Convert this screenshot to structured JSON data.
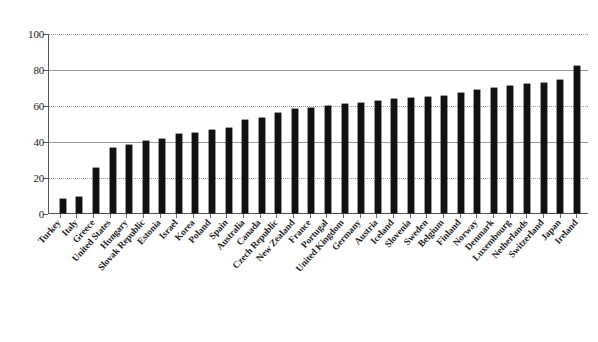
{
  "chart_data": {
    "type": "bar",
    "title": "",
    "subtitle": "",
    "xlabel": "",
    "ylabel": "",
    "ylim": [
      0,
      100
    ],
    "yticks": [
      0,
      20,
      40,
      60,
      80,
      100
    ],
    "grid": "horizontal",
    "legend": "none",
    "orientation": "vertical",
    "sorted": "ascending",
    "bar_color": "#111111",
    "categories": [
      "Turkey",
      "Italy",
      "Greece",
      "United States",
      "Hungary",
      "Slovak Republic",
      "Estonia",
      "Israel",
      "Korea",
      "Poland",
      "Spain",
      "Australia",
      "Canada",
      "Czech Republic",
      "New Zealand",
      "France",
      "Portugal",
      "United Kingdom",
      "Germany",
      "Austria",
      "Iceland",
      "Slovenia",
      "Sweden",
      "Belgium",
      "Finland",
      "Norway",
      "Denmark",
      "Luxembourg",
      "Netherlands",
      "Switzerland",
      "Japan",
      "Ireland"
    ],
    "values": [
      8,
      9,
      25,
      36.5,
      38,
      40,
      41.5,
      44,
      44.5,
      46.5,
      47.5,
      52,
      53,
      56,
      58,
      58.5,
      60,
      61,
      61.5,
      62.5,
      63.5,
      64,
      65,
      65.5,
      67,
      69,
      70,
      71,
      72,
      72.5,
      74.5,
      82
    ]
  },
  "axis": {
    "y_tick_labels": [
      "100",
      "80",
      "60",
      "40",
      "20",
      "0"
    ]
  }
}
